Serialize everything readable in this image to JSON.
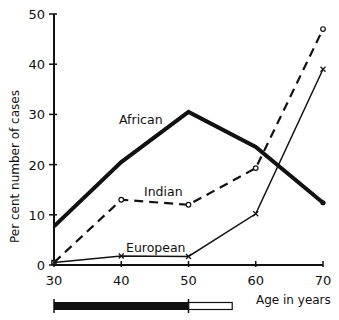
{
  "chart_data": {
    "type": "line",
    "title": "",
    "xlabel": "Age in years",
    "ylabel": "Per cent number of cases",
    "x": [
      30,
      40,
      50,
      60,
      70
    ],
    "xlim": [
      30,
      70
    ],
    "ylim": [
      0,
      50
    ],
    "x_ticks": [
      "30",
      "40",
      "50",
      "60",
      "70"
    ],
    "y_ticks": [
      "0",
      "10",
      "20",
      "30",
      "40",
      "50"
    ],
    "grid": false,
    "legend": "inline labels",
    "series": [
      {
        "name": "African",
        "style": "thick solid",
        "marker": "dot",
        "values": [
          7.7,
          20.5,
          30.5,
          23.5,
          12.4
        ]
      },
      {
        "name": "Indian",
        "style": "dashed",
        "marker": "o",
        "values": [
          0.5,
          13,
          12,
          19.3,
          47
        ]
      },
      {
        "name": "European",
        "style": "thin solid",
        "marker": "x",
        "values": [
          0.5,
          1.8,
          1.7,
          10.2,
          39
        ]
      }
    ],
    "annotations": [
      {
        "type": "range-bar",
        "solid_from": 30,
        "solid_to": 50,
        "open_from": 50,
        "open_to": 56.5
      }
    ]
  },
  "labels": {
    "african": "African",
    "indian": "Indian",
    "european": "European",
    "xlabel": "Age in years",
    "ylabel": "Per cent number of cases"
  },
  "colors": {
    "ink": "#111111",
    "background": "#ffffff"
  }
}
